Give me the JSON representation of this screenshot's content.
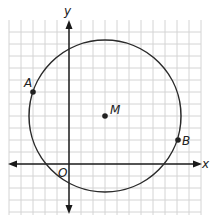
{
  "figure": {
    "axes": {
      "x_label": "x",
      "y_label": "y",
      "origin_label": "O"
    },
    "grid": {
      "spacing_units": 1,
      "x_range": [
        -5,
        11
      ],
      "y_range": [
        -4,
        11
      ]
    },
    "circle": {
      "center_label": "M",
      "center": [
        3,
        4
      ],
      "radius_units": 6.32
    },
    "points": [
      {
        "label": "A",
        "coords": [
          -3,
          6
        ]
      },
      {
        "label": "B",
        "coords": [
          9,
          2
        ]
      },
      {
        "label": "M",
        "coords": [
          3,
          4
        ]
      }
    ],
    "colors": {
      "grid": "#d4d4d4",
      "axis": "#1a1a1a",
      "circle": "#2a2a2a"
    }
  }
}
